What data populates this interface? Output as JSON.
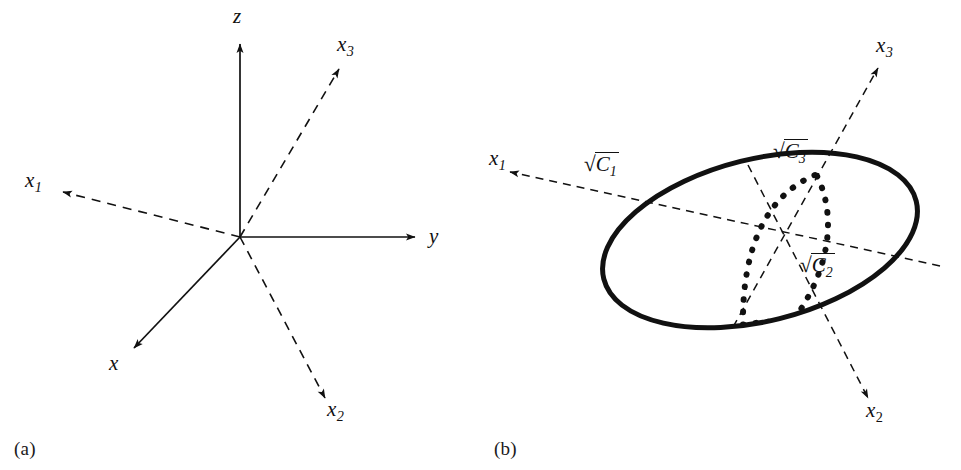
{
  "figure": {
    "background_color": "#ffffff",
    "line_color": "#111111"
  },
  "panel_a": {
    "caption": "(a)",
    "description": "Cartesian axes x, y, z shown as solid arrows with principal axes x1, x2, x3 shown as dashed arrows",
    "labels": {
      "z": "z",
      "y": "y",
      "x": "x",
      "x1": "x",
      "x1_sub": "1",
      "x2": "x",
      "x2_sub": "2",
      "x3": "x",
      "x3_sub": "3"
    },
    "axes": [
      {
        "name": "z-axis",
        "style": "solid",
        "label": "z"
      },
      {
        "name": "y-axis",
        "style": "solid",
        "label": "y"
      },
      {
        "name": "x-axis",
        "style": "solid",
        "label": "x"
      },
      {
        "name": "x1-axis",
        "style": "dashed",
        "label": "x1"
      },
      {
        "name": "x2-axis",
        "style": "dashed",
        "label": "x2"
      },
      {
        "name": "x3-axis",
        "style": "dashed",
        "label": "x3"
      }
    ]
  },
  "panel_b": {
    "caption": "(b)",
    "description": "Ellipsoid drawn as a heavy ellipse with dashed principal axes x1, x2, x3 and semi-axis lengths labeled",
    "labels": {
      "x1": "x",
      "x1_sub": "1",
      "x2": "x",
      "x2_sub": "2",
      "x3": "x",
      "x3_sub": "3"
    },
    "semi_axis_labels": [
      {
        "name": "sqrt-C1",
        "radical": "√",
        "radicand": "C",
        "subscript": "1"
      },
      {
        "name": "sqrt-C2",
        "radical": "√",
        "radicand": "C",
        "subscript": "2"
      },
      {
        "name": "sqrt-C3",
        "radical": "√",
        "radicand": "C",
        "subscript": "3"
      }
    ],
    "axes": [
      {
        "name": "x1-axis",
        "style": "dashed",
        "label": "x1"
      },
      {
        "name": "x2-axis",
        "style": "dashed",
        "label": "x2"
      },
      {
        "name": "x3-axis",
        "style": "dashed",
        "label": "x3"
      }
    ],
    "ellipse": {
      "stroke": "#111111",
      "stroke_width": 5,
      "style": "solid"
    },
    "hidden_arc": {
      "stroke": "#111111",
      "style": "dotted"
    }
  }
}
